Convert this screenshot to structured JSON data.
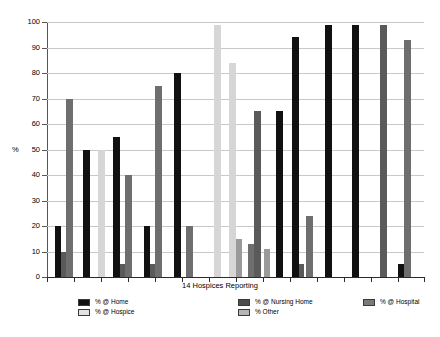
{
  "chart_data": {
    "type": "bar",
    "title": "",
    "xlabel": "14 Hospices Reporting",
    "ylabel": "%",
    "ylim": [
      0,
      100
    ],
    "yticks": [
      0,
      10,
      20,
      30,
      40,
      50,
      60,
      70,
      80,
      90,
      100
    ],
    "grid": true,
    "legend_position": "bottom",
    "categories": [
      "Hospice 1",
      "Hospice 2",
      "Hospice 3",
      "Hospice 4",
      "Hospice 5",
      "Hospice 6",
      "Hospice 7",
      "Hospice 8",
      "Hospice 9",
      "Hospice 10",
      "Hospice 11",
      "Hospice 12",
      "Hospice 13",
      "Hospice 14"
    ],
    "series": [
      {
        "name": "% @ Home",
        "color": "#111111",
        "values": [
          20,
          50,
          0,
          55,
          20,
          0,
          0,
          0,
          0,
          65,
          0,
          99,
          0,
          5
        ]
      },
      {
        "name": "% @ Nursing Home",
        "color": "#5a5a5a",
        "values": [
          10,
          0,
          0,
          5,
          5,
          0,
          0,
          0,
          0,
          5,
          0,
          0,
          0,
          0
        ]
      },
      {
        "name": "% @ Hospital",
        "color": "#707070",
        "values": [
          70,
          0,
          0,
          40,
          75,
          20,
          0,
          0,
          13,
          24,
          0,
          0,
          99,
          93
        ]
      },
      {
        "name": "% @ Hospice",
        "color": "#d6d6d6",
        "values": [
          0,
          0,
          50,
          0,
          0,
          0,
          99,
          84,
          0,
          0,
          0,
          0,
          0,
          0
        ]
      },
      {
        "name": "% Other",
        "color": "#9a9a9a",
        "values": [
          0,
          0,
          0,
          0,
          0,
          0,
          0,
          15,
          11,
          0,
          65,
          0,
          0,
          0
        ]
      }
    ],
    "bars": [
      {
        "x": 55,
        "value": 20,
        "color": "#111111",
        "width": 6,
        "series": "% @ Home"
      },
      {
        "x": 61,
        "value": 10,
        "color": "#5a5a5a",
        "width": 5,
        "series": "% @ Nursing Home"
      },
      {
        "x": 66,
        "value": 70,
        "color": "#6e6e6e",
        "width": 7,
        "series": "% @ Hospital"
      },
      {
        "x": 83,
        "value": 50,
        "color": "#111111",
        "width": 7,
        "series": "% @ Home"
      },
      {
        "x": 98,
        "value": 50,
        "color": "#d6d6d6",
        "width": 7,
        "series": "% @ Hospice"
      },
      {
        "x": 113,
        "value": 55,
        "color": "#111111",
        "width": 7,
        "series": "% @ Home"
      },
      {
        "x": 120,
        "value": 5,
        "color": "#5a5a5a",
        "width": 5,
        "series": "% @ Nursing Home"
      },
      {
        "x": 125,
        "value": 40,
        "color": "#6e6e6e",
        "width": 7,
        "series": "% @ Hospital"
      },
      {
        "x": 144,
        "value": 20,
        "color": "#111111",
        "width": 6,
        "series": "% @ Home"
      },
      {
        "x": 150,
        "value": 5,
        "color": "#5a5a5a",
        "width": 5,
        "series": "% @ Nursing Home"
      },
      {
        "x": 155,
        "value": 75,
        "color": "#6e6e6e",
        "width": 7,
        "series": "% @ Hospital"
      },
      {
        "x": 174,
        "value": 80,
        "color": "#111111",
        "width": 7,
        "series": "% @ Home"
      },
      {
        "x": 186,
        "value": 20,
        "color": "#6e6e6e",
        "width": 7,
        "series": "% @ Hospital"
      },
      {
        "x": 214,
        "value": 99,
        "color": "#d6d6d6",
        "width": 7,
        "series": "% @ Hospice"
      },
      {
        "x": 229,
        "value": 84,
        "color": "#d6d6d6",
        "width": 7,
        "series": "% @ Hospice"
      },
      {
        "x": 236,
        "value": 15,
        "color": "#9a9a9a",
        "width": 6,
        "series": "% Other"
      },
      {
        "x": 248,
        "value": 13,
        "color": "#6e6e6e",
        "width": 6,
        "series": "% @ Hospital"
      },
      {
        "x": 254,
        "value": 65,
        "color": "#5a5a5a",
        "width": 7,
        "series": "% @ Nursing Home"
      },
      {
        "x": 264,
        "value": 11,
        "color": "#9a9a9a",
        "width": 6,
        "series": "% Other"
      },
      {
        "x": 276,
        "value": 65,
        "color": "#111111",
        "width": 7,
        "series": "% @ Home"
      },
      {
        "x": 292,
        "value": 94,
        "color": "#111111",
        "width": 7,
        "series": "% @ Home"
      },
      {
        "x": 299,
        "value": 5,
        "color": "#5a5a5a",
        "width": 5,
        "series": "% @ Nursing Home"
      },
      {
        "x": 306,
        "value": 24,
        "color": "#6e6e6e",
        "width": 7,
        "series": "% @ Hospital"
      },
      {
        "x": 325,
        "value": 99,
        "color": "#111111",
        "width": 7,
        "series": "% @ Home"
      },
      {
        "x": 352,
        "value": 99,
        "color": "#111111",
        "width": 7,
        "series": "% @ Home"
      },
      {
        "x": 380,
        "value": 99,
        "color": "#5a5a5a",
        "width": 7,
        "series": "% @ Hospital"
      },
      {
        "x": 398,
        "value": 5,
        "color": "#111111",
        "width": 6,
        "series": "% @ Home"
      },
      {
        "x": 404,
        "value": 93,
        "color": "#6e6e6e",
        "width": 7,
        "series": "% @ Hospital"
      }
    ],
    "x_ticks": [
      47,
      74,
      101,
      128,
      155,
      182,
      209,
      236,
      263,
      290,
      317,
      344,
      371,
      398,
      424
    ]
  },
  "legend": {
    "entries": [
      {
        "label": "% @ Home",
        "color": "#111111",
        "col": 0,
        "row": 0
      },
      {
        "label": "% @ Hospice",
        "color": "#e2e2e2",
        "col": 0,
        "row": 1
      },
      {
        "label": "% @ Nursing Home",
        "color": "#4d4d4d",
        "col": 1,
        "row": 0
      },
      {
        "label": "% Other",
        "color": "#b5b5b5",
        "col": 1,
        "row": 1
      },
      {
        "label": "% @ Hospital",
        "color": "#7a7a7a",
        "col": 2,
        "row": 0
      }
    ]
  }
}
